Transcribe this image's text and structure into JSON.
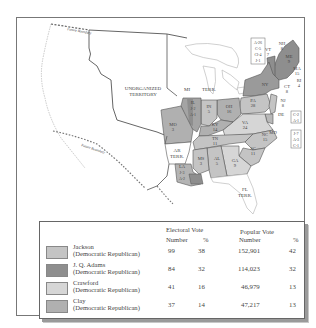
{
  "map": {
    "region_labels": {
      "unorganized": [
        "UNORGANIZED",
        "TERRITORY"
      ],
      "mi_terr": [
        "MI",
        "TERR."
      ],
      "ar_terr": [
        "AR",
        "TERR."
      ],
      "fl_terr": [
        "FL",
        "TERR."
      ],
      "future_boundary_north": "Future Boundary",
      "future_boundary_south": "Future Boundary"
    },
    "states": [
      {
        "abbr": "ME",
        "votes": "9",
        "winner": "Adams"
      },
      {
        "abbr": "NH",
        "votes": "8",
        "winner": "Adams"
      },
      {
        "abbr": "VT",
        "votes": "7",
        "winner": "Adams"
      },
      {
        "abbr": "MA",
        "votes": "15",
        "winner": "Adams"
      },
      {
        "abbr": "RI",
        "votes": "4",
        "winner": "Adams"
      },
      {
        "abbr": "CT",
        "votes": "8",
        "winner": "Adams"
      },
      {
        "abbr": "NY",
        "votes": "",
        "winner": "Split"
      },
      {
        "abbr": "NJ",
        "votes": "8",
        "winner": "Jackson"
      },
      {
        "abbr": "PA",
        "votes": "28",
        "winner": "Jackson"
      },
      {
        "abbr": "DE",
        "votes": "",
        "winner": "Split"
      },
      {
        "abbr": "MD",
        "votes": "",
        "winner": "Split"
      },
      {
        "abbr": "VA",
        "votes": "24",
        "winner": "Crawford"
      },
      {
        "abbr": "NC",
        "votes": "15",
        "winner": "Jackson"
      },
      {
        "abbr": "SC",
        "votes": "11",
        "winner": "Jackson"
      },
      {
        "abbr": "GA",
        "votes": "9",
        "winner": "Crawford"
      },
      {
        "abbr": "AL",
        "votes": "5",
        "winner": "Jackson"
      },
      {
        "abbr": "MS",
        "votes": "3",
        "winner": "Jackson"
      },
      {
        "abbr": "LA",
        "votes": "",
        "winner": "Split"
      },
      {
        "abbr": "TN",
        "votes": "11",
        "winner": "Jackson"
      },
      {
        "abbr": "KY",
        "votes": "14",
        "winner": "Clay"
      },
      {
        "abbr": "OH",
        "votes": "16",
        "winner": "Clay"
      },
      {
        "abbr": "IN",
        "votes": "5",
        "winner": "Jackson"
      },
      {
        "abbr": "IL",
        "votes": "",
        "winner": "Split"
      },
      {
        "abbr": "MO",
        "votes": "3",
        "winner": "Clay"
      }
    ],
    "split_boxes": {
      "ny": [
        "A-26",
        "C-5",
        "Cl-4",
        "J-1"
      ],
      "de": [
        "C-2",
        "A-1"
      ],
      "md": [
        "J-7",
        "A-3",
        "C-1"
      ],
      "il": [
        "J-2",
        "A-1"
      ],
      "la": [
        "J-3",
        "A-2"
      ]
    }
  },
  "legend": {
    "headers": {
      "electoral": "Electoral Vote",
      "popular": "Popular Vote",
      "number": "Number",
      "percent": "%"
    },
    "rows": [
      {
        "name": "Jackson",
        "party": "(Democratic Republican)",
        "ev_num": "99",
        "ev_pct": "38",
        "pv_num": "152,901",
        "pv_pct": "42",
        "color": "#c4c4c4"
      },
      {
        "name": "J. Q. Adams",
        "party": "(Democratic Republican)",
        "ev_num": "84",
        "ev_pct": "32",
        "pv_num": "114,023",
        "pv_pct": "32",
        "color": "#8e8e8e"
      },
      {
        "name": "Crawford",
        "party": "(Democratic Republican)",
        "ev_num": "41",
        "ev_pct": "16",
        "pv_num": "46,979",
        "pv_pct": "13",
        "color": "#d6d6d6"
      },
      {
        "name": "Clay",
        "party": "(Democratic Republican)",
        "ev_num": "37",
        "ev_pct": "14",
        "pv_num": "47,217",
        "pv_pct": "13",
        "color": "#b0b0b0"
      }
    ]
  }
}
